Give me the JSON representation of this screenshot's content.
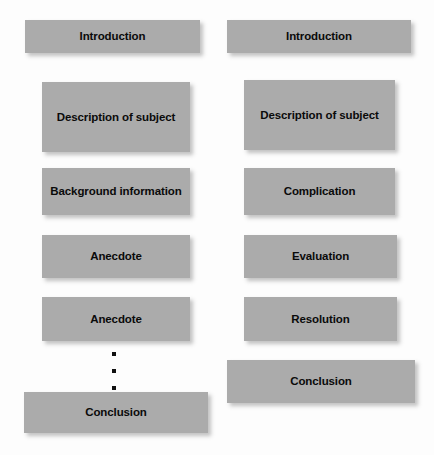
{
  "diagram": {
    "background_color": "#fdfdfd",
    "box_color": "#ababab",
    "text_color": "#0a0a0a",
    "columns": [
      {
        "name": "left-column",
        "boxes": [
          {
            "label": "Introduction",
            "x": 25,
            "y": 20,
            "w": 175,
            "h": 33
          },
          {
            "label": "Description of subject",
            "x": 42,
            "y": 82,
            "w": 148,
            "h": 70
          },
          {
            "label": "Background information",
            "x": 42,
            "y": 168,
            "w": 148,
            "h": 47
          },
          {
            "label": "Anecdote",
            "x": 42,
            "y": 235,
            "w": 148,
            "h": 43
          },
          {
            "label": "Anecdote",
            "x": 42,
            "y": 297,
            "w": 148,
            "h": 44
          },
          {
            "label": "Conclusion",
            "x": 24,
            "y": 392,
            "w": 184,
            "h": 41
          }
        ],
        "ellipsis": {
          "x": 111,
          "y": 352,
          "dots": 3
        }
      },
      {
        "name": "right-column",
        "boxes": [
          {
            "label": "Introduction",
            "x": 227,
            "y": 20,
            "w": 184,
            "h": 33
          },
          {
            "label": "Description of subject",
            "x": 244,
            "y": 80,
            "w": 151,
            "h": 70
          },
          {
            "label": "Complication",
            "x": 244,
            "y": 168,
            "w": 151,
            "h": 47
          },
          {
            "label": "Evaluation",
            "x": 244,
            "y": 235,
            "w": 153,
            "h": 43
          },
          {
            "label": "Resolution",
            "x": 244,
            "y": 297,
            "w": 153,
            "h": 44
          },
          {
            "label": "Conclusion",
            "x": 227,
            "y": 360,
            "w": 188,
            "h": 43
          }
        ],
        "ellipsis": null
      }
    ]
  }
}
